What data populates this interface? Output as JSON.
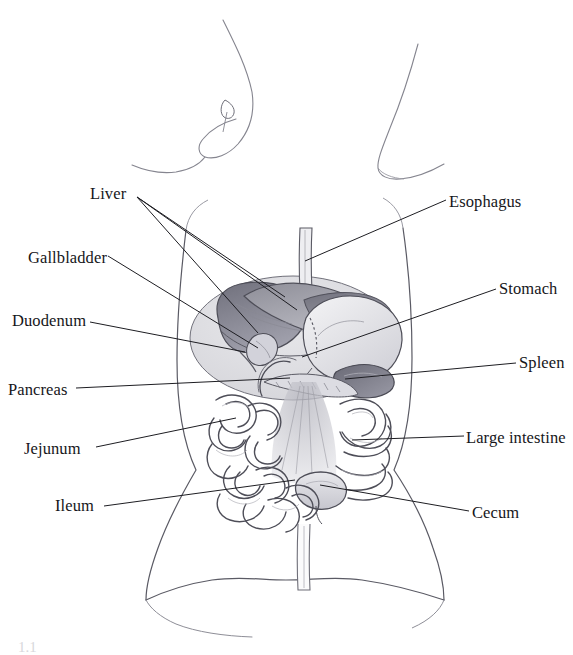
{
  "figure": {
    "style": "pencil sketch",
    "width": 573,
    "height": 655,
    "background_color": "#ffffff",
    "ink_color": "#16161a",
    "sketch_color": "#6e6e78"
  },
  "labels": [
    {
      "id": "liver",
      "text": "Liver",
      "x": 90,
      "y": 186,
      "side": "left"
    },
    {
      "id": "gallbladder",
      "text": "Gallbladder",
      "x": 28,
      "y": 250,
      "side": "left"
    },
    {
      "id": "duodenum",
      "text": "Duodenum",
      "x": 12,
      "y": 313,
      "side": "left"
    },
    {
      "id": "pancreas",
      "text": "Pancreas",
      "x": 8,
      "y": 382,
      "side": "left"
    },
    {
      "id": "jejunum",
      "text": "Jejunum",
      "x": 24,
      "y": 441,
      "side": "left"
    },
    {
      "id": "ileum",
      "text": "Ileum",
      "x": 55,
      "y": 498,
      "side": "left"
    },
    {
      "id": "esophagus",
      "text": "Esophagus",
      "x": 449,
      "y": 194,
      "side": "right"
    },
    {
      "id": "stomach",
      "text": "Stomach",
      "x": 499,
      "y": 281,
      "side": "right"
    },
    {
      "id": "spleen",
      "text": "Spleen",
      "x": 519,
      "y": 355,
      "side": "right"
    },
    {
      "id": "large-intestine",
      "text": "Large intestine",
      "x": 466,
      "y": 430,
      "side": "right"
    },
    {
      "id": "cecum",
      "text": "Cecum",
      "x": 472,
      "y": 505,
      "side": "right"
    }
  ],
  "caption": {
    "fragment": "1.1"
  },
  "leader_lines": [
    {
      "id": "liver-1",
      "from": [
        137,
        197
      ],
      "to": [
        285,
        297
      ]
    },
    {
      "id": "liver-2",
      "from": [
        137,
        197
      ],
      "to": [
        297,
        310
      ]
    },
    {
      "id": "liver-3",
      "from": [
        137,
        197
      ],
      "to": [
        258,
        333
      ]
    },
    {
      "id": "gallbladder",
      "from": [
        108,
        256
      ],
      "to": [
        258,
        348
      ]
    },
    {
      "id": "duodenum",
      "from": [
        90,
        322
      ],
      "to": [
        245,
        352
      ]
    },
    {
      "id": "pancreas",
      "from": [
        76,
        388
      ],
      "to": [
        290,
        378
      ]
    },
    {
      "id": "jejunum",
      "from": [
        96,
        447
      ],
      "to": [
        236,
        418
      ]
    },
    {
      "id": "ileum",
      "from": [
        104,
        506
      ],
      "to": [
        295,
        480
      ]
    },
    {
      "id": "esophagus",
      "from": [
        446,
        200
      ],
      "to": [
        305,
        261
      ]
    },
    {
      "id": "stomach",
      "from": [
        496,
        289
      ],
      "to": [
        302,
        357
      ]
    },
    {
      "id": "spleen",
      "from": [
        516,
        363
      ],
      "to": [
        345,
        379
      ]
    },
    {
      "id": "large-intestine",
      "from": [
        464,
        436
      ],
      "to": [
        352,
        440
      ]
    },
    {
      "id": "cecum",
      "from": [
        469,
        511
      ],
      "to": [
        320,
        485
      ]
    }
  ],
  "organs": [
    {
      "id": "esophagus-tube",
      "name": "esophagus"
    },
    {
      "id": "liver-lobe",
      "name": "liver"
    },
    {
      "id": "gallbladder-sac",
      "name": "gallbladder"
    },
    {
      "id": "stomach-body",
      "name": "stomach"
    },
    {
      "id": "spleen-body",
      "name": "spleen"
    },
    {
      "id": "duodenum-loop",
      "name": "duodenum"
    },
    {
      "id": "pancreas-body",
      "name": "pancreas"
    },
    {
      "id": "small-intestine",
      "name": "jejunum and ileum"
    },
    {
      "id": "large-intestine-frame",
      "name": "large intestine"
    },
    {
      "id": "cecum-pouch",
      "name": "cecum"
    }
  ]
}
